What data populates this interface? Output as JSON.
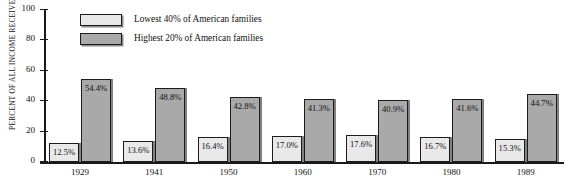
{
  "chart_data": {
    "type": "bar",
    "title": "",
    "xlabel": "",
    "ylabel": "PERCENT OF ALL INCOME RECEIVED",
    "ylim": [
      0,
      100
    ],
    "yticks": [
      0,
      20,
      40,
      60,
      80,
      100
    ],
    "grid": false,
    "legend_position": "top-center",
    "categories": [
      "1929",
      "1941",
      "1950",
      "1960",
      "1970",
      "1980",
      "1989"
    ],
    "series": [
      {
        "name": "Lowest 40% of American families",
        "color": "#e9e9e9",
        "values": [
          12.5,
          13.6,
          16.4,
          17.0,
          17.6,
          16.7,
          15.3
        ],
        "labels": [
          "12.5%",
          "13.6%",
          "16.4%",
          "17.0%",
          "17.6%",
          "16.7%",
          "15.3%"
        ]
      },
      {
        "name": "Highest 20% of American families",
        "color": "#a9a9a9",
        "values": [
          54.4,
          48.8,
          42.8,
          41.3,
          40.9,
          41.6,
          44.7
        ],
        "labels": [
          "54.4%",
          "48.8%",
          "42.8%",
          "41.3%",
          "40.9%",
          "41.6%",
          "44.7%"
        ]
      }
    ]
  },
  "axis": {
    "ytick_labels": [
      "100",
      "80",
      "60",
      "40",
      "20",
      "0"
    ],
    "ylabel": "PERCENT OF ALL INCOME RECEIVED"
  },
  "legend": {
    "items": [
      {
        "label": "Lowest 40% of American families",
        "swatch": "low"
      },
      {
        "label": "Highest 20% of American families",
        "swatch": "high"
      }
    ]
  },
  "colors": {
    "series_low": "#e9e9e9",
    "series_high": "#a9a9a9",
    "outline": "#1c1c1c",
    "background": "#ffffff"
  }
}
